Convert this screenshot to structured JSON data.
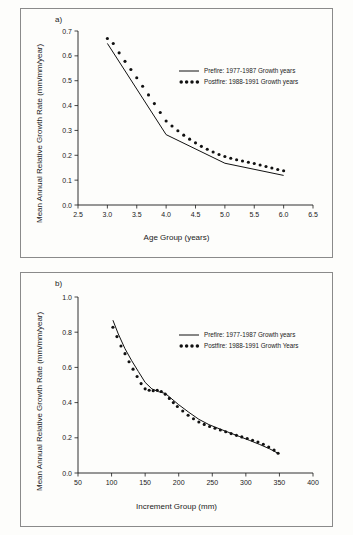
{
  "figure": {
    "background_color": "#fdfdfb",
    "ink_color": "#111111"
  },
  "panels": [
    {
      "label": "a)",
      "legend": {
        "line_entry": "Prefire: 1977-1987 Growth years",
        "dot_entry": "Postfire: 1988-1991 Growth years"
      }
    },
    {
      "label": "b)",
      "legend": {
        "line_entry": "Prefire: 1977-1987 Growth years",
        "dot_entry": "Postfire: 1988-1991 Growth Years"
      }
    }
  ],
  "chart_data": [
    {
      "type": "line",
      "panel": "a)",
      "title": "",
      "xlabel": "Age Group (years)",
      "ylabel": "Mean Annual Relative Growth Rate (mm/mm/year)",
      "xlim": [
        2.5,
        6.5
      ],
      "ylim": [
        0.0,
        0.7
      ],
      "xticks": [
        2.5,
        3.0,
        3.5,
        4.0,
        4.5,
        5.0,
        5.5,
        6.0,
        6.5
      ],
      "xticklabels": [
        "2.5",
        "3.0",
        "3.5",
        "4.0",
        "4.5",
        "5.0",
        "5.5",
        "6.0",
        "6.5"
      ],
      "yticks": [
        0.0,
        0.1,
        0.2,
        0.3,
        0.4,
        0.5,
        0.6,
        0.7
      ],
      "yticklabels": [
        "0.0",
        "0.1",
        "0.2",
        "0.3",
        "0.4",
        "0.5",
        "0.6",
        "0.7"
      ],
      "grid": false,
      "legend_position": "upper right",
      "series": [
        {
          "name": "Prefire: 1977-1987 Growth years",
          "style": "solid-line",
          "x": [
            3.0,
            4.0,
            5.0,
            6.0
          ],
          "values": [
            0.65,
            0.283,
            0.168,
            0.119
          ]
        },
        {
          "name": "Postfire: 1988-1991 Growth years",
          "style": "dotted",
          "x": [
            3.0,
            3.1,
            3.2,
            3.3,
            3.4,
            3.5,
            3.6,
            3.7,
            3.8,
            3.9,
            4.0,
            4.1,
            4.2,
            4.3,
            4.4,
            4.5,
            4.6,
            4.7,
            4.8,
            4.9,
            5.0,
            5.1,
            5.2,
            5.3,
            5.4,
            5.5,
            5.6,
            5.7,
            5.8,
            5.9,
            6.0
          ],
          "values": [
            0.67,
            0.65,
            0.612,
            0.578,
            0.545,
            0.512,
            0.478,
            0.443,
            0.408,
            0.372,
            0.338,
            0.318,
            0.299,
            0.281,
            0.265,
            0.25,
            0.236,
            0.224,
            0.213,
            0.203,
            0.195,
            0.188,
            0.182,
            0.177,
            0.172,
            0.167,
            0.161,
            0.155,
            0.149,
            0.143,
            0.138
          ]
        }
      ]
    },
    {
      "type": "line",
      "panel": "b)",
      "title": "",
      "xlabel": "Increment Group (mm)",
      "ylabel": "Mean Annual Relative Growth Rate (mm/mm/year)",
      "xlim": [
        50,
        400
      ],
      "ylim": [
        0.0,
        1.0
      ],
      "xticks": [
        50,
        100,
        150,
        200,
        250,
        300,
        350,
        400
      ],
      "xticklabels": [
        "50",
        "100",
        "150",
        "200",
        "250",
        "300",
        "350",
        "400"
      ],
      "yticks": [
        0.0,
        0.2,
        0.4,
        0.6,
        0.8,
        1.0
      ],
      "yticklabels": [
        "0.0",
        "0.2",
        "0.4",
        "0.6",
        "0.8",
        "1.0"
      ],
      "grid": false,
      "legend_position": "upper right",
      "series": [
        {
          "name": "Prefire: 1977-1987 Growth years",
          "style": "solid-line",
          "x": [
            102,
            110,
            120,
            130,
            140,
            150,
            160,
            170,
            180,
            190,
            200,
            215,
            230,
            245,
            260,
            275,
            290,
            305,
            320,
            335,
            348
          ],
          "values": [
            0.868,
            0.79,
            0.706,
            0.638,
            0.576,
            0.515,
            0.478,
            0.462,
            0.452,
            0.42,
            0.388,
            0.345,
            0.305,
            0.275,
            0.252,
            0.23,
            0.208,
            0.186,
            0.163,
            0.138,
            0.112
          ]
        },
        {
          "name": "Postfire: 1988-1991 Growth Years",
          "style": "dotted",
          "x": [
            102,
            108,
            114,
            120,
            126,
            132,
            138,
            144,
            150,
            156,
            162,
            168,
            174,
            180,
            186,
            192,
            198,
            206,
            214,
            222,
            230,
            238,
            246,
            254,
            262,
            270,
            278,
            286,
            294,
            302,
            310,
            318,
            326,
            334,
            342,
            348
          ],
          "values": [
            0.828,
            0.775,
            0.722,
            0.678,
            0.632,
            0.59,
            0.548,
            0.508,
            0.478,
            0.47,
            0.468,
            0.47,
            0.463,
            0.448,
            0.424,
            0.4,
            0.378,
            0.352,
            0.328,
            0.308,
            0.29,
            0.276,
            0.264,
            0.254,
            0.244,
            0.234,
            0.224,
            0.214,
            0.205,
            0.196,
            0.186,
            0.176,
            0.163,
            0.148,
            0.13,
            0.112
          ]
        }
      ]
    }
  ]
}
